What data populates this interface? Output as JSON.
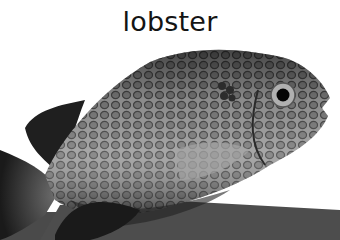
{
  "caption": {
    "label": "lobster"
  },
  "image": {
    "subject": "spotted fish (rabbitfish) in grayscale",
    "palette": {
      "background": "#ffffff",
      "ground": "#4a4a4a",
      "body": "#8a8a8a",
      "dark": "#1e1e1e",
      "spot_ring": "#3a3a3a"
    }
  }
}
